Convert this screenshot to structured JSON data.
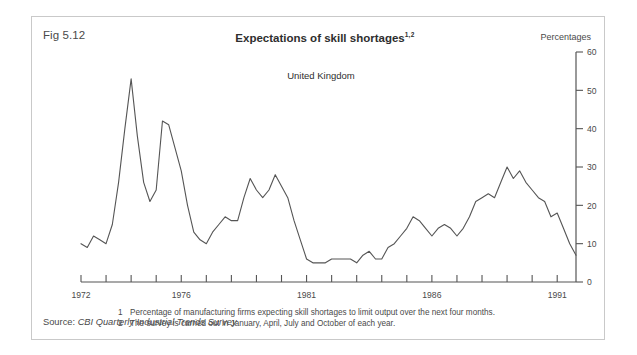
{
  "figure": {
    "number": "Fig 5.12",
    "title": "Expectations of skill shortages",
    "title_superscript": "1,2",
    "units_label": "Percentages",
    "region_label": "United Kingdom",
    "source_prefix": "Source:",
    "source_text": "CBI Quarterly Industrial Trends Survey",
    "footnotes": [
      {
        "num": "1",
        "text": "Percentage of manufacturing firms expecting skill shortages to limit output over the next four months."
      },
      {
        "num": "2",
        "text": "The survey is carried out in January, April, July and October of each year."
      }
    ]
  },
  "chart_data": {
    "type": "line",
    "title": "Expectations of skill shortages",
    "subtitle": "United Kingdom",
    "xlabel": "",
    "ylabel": "Percentages",
    "ylim": [
      0,
      60
    ],
    "yticks": [
      0,
      10,
      20,
      30,
      40,
      50,
      60
    ],
    "ytick_labels": [
      "0",
      "10",
      "20",
      "30",
      "40",
      "50",
      "60"
    ],
    "xlim": [
      1972,
      1991.75
    ],
    "xticks": [
      1972,
      1973,
      1974,
      1975,
      1976,
      1977,
      1978,
      1979,
      1980,
      1981,
      1982,
      1983,
      1984,
      1985,
      1986,
      1987,
      1988,
      1989,
      1990,
      1991
    ],
    "xtick_labels_shown": [
      "1972",
      "1976",
      "1981",
      "1986",
      "1991"
    ],
    "xtick_labels_shown_at": [
      1972,
      1976,
      1981,
      1986,
      1991
    ],
    "grid": false,
    "legend": false,
    "line_color": "#555555",
    "frequency": "quarterly",
    "series": [
      {
        "name": "Expectations of skill shortages",
        "x": [
          1972.0,
          1972.25,
          1972.5,
          1972.75,
          1973.0,
          1973.25,
          1973.5,
          1973.75,
          1974.0,
          1974.25,
          1974.5,
          1974.75,
          1975.0,
          1975.25,
          1975.5,
          1975.75,
          1976.0,
          1976.25,
          1976.5,
          1976.75,
          1977.0,
          1977.25,
          1977.5,
          1977.75,
          1978.0,
          1978.25,
          1978.5,
          1978.75,
          1979.0,
          1979.25,
          1979.5,
          1979.75,
          1980.0,
          1980.25,
          1980.5,
          1980.75,
          1981.0,
          1981.25,
          1981.5,
          1981.75,
          1982.0,
          1982.25,
          1982.5,
          1982.75,
          1983.0,
          1983.25,
          1983.5,
          1983.75,
          1984.0,
          1984.25,
          1984.5,
          1984.75,
          1985.0,
          1985.25,
          1985.5,
          1985.75,
          1986.0,
          1986.25,
          1986.5,
          1986.75,
          1987.0,
          1987.25,
          1987.5,
          1987.75,
          1988.0,
          1988.25,
          1988.5,
          1988.75,
          1989.0,
          1989.25,
          1989.5,
          1989.75,
          1990.0,
          1990.25,
          1990.5,
          1990.75,
          1991.0,
          1991.25,
          1991.5,
          1991.75
        ],
        "values": [
          10,
          9,
          12,
          11,
          10,
          15,
          26,
          40,
          53,
          38,
          26,
          21,
          24,
          42,
          41,
          35,
          29,
          20,
          13,
          11,
          10,
          13,
          15,
          17,
          16,
          16,
          22,
          27,
          24,
          22,
          24,
          28,
          25,
          22,
          16,
          11,
          6,
          5,
          5,
          5,
          6,
          6,
          6,
          6,
          5,
          7,
          8,
          6,
          6,
          9,
          10,
          12,
          14,
          17,
          16,
          14,
          12,
          14,
          15,
          14,
          12,
          14,
          17,
          21,
          22,
          23,
          22,
          26,
          30,
          27,
          29,
          26,
          24,
          22,
          21,
          17,
          18,
          14,
          10,
          7
        ]
      }
    ]
  }
}
